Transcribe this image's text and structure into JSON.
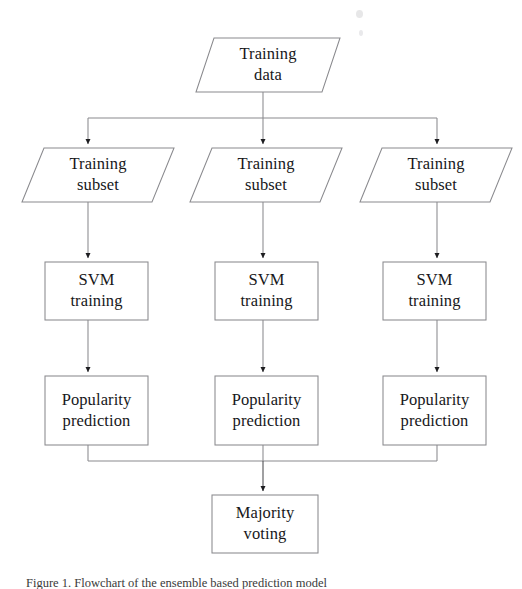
{
  "diagram": {
    "type": "flowchart",
    "orientation": "top-to-bottom",
    "stroke_color": "#8a8a8e",
    "text_color": "#17171a",
    "background": "#ffffff",
    "nodes": [
      {
        "id": "training-data",
        "shape": "parallelogram",
        "line1": "Training",
        "line2": "data",
        "x": 196,
        "y": 38,
        "w": 144,
        "h": 54
      },
      {
        "id": "training-subset-1",
        "shape": "parallelogram",
        "line1": "Training",
        "line2": "subset",
        "x": 22,
        "y": 148,
        "w": 152,
        "h": 54
      },
      {
        "id": "training-subset-2",
        "shape": "parallelogram",
        "line1": "Training",
        "line2": "subset",
        "x": 190,
        "y": 148,
        "w": 152,
        "h": 54
      },
      {
        "id": "training-subset-3",
        "shape": "parallelogram",
        "line1": "Training",
        "line2": "subset",
        "x": 360,
        "y": 148,
        "w": 152,
        "h": 54
      },
      {
        "id": "svm-training-1",
        "shape": "rectangle",
        "line1": "SVM",
        "line2": "training",
        "x": 45,
        "y": 262,
        "w": 103,
        "h": 58
      },
      {
        "id": "svm-training-2",
        "shape": "rectangle",
        "line1": "SVM",
        "line2": "training",
        "x": 215,
        "y": 262,
        "w": 103,
        "h": 58
      },
      {
        "id": "svm-training-3",
        "shape": "rectangle",
        "line1": "SVM",
        "line2": "training",
        "x": 383,
        "y": 262,
        "w": 103,
        "h": 58
      },
      {
        "id": "popularity-prediction-1",
        "shape": "rectangle",
        "line1": "Popularity",
        "line2": "prediction",
        "x": 45,
        "y": 376,
        "w": 103,
        "h": 69
      },
      {
        "id": "popularity-prediction-2",
        "shape": "rectangle",
        "line1": "Popularity",
        "line2": "prediction",
        "x": 215,
        "y": 376,
        "w": 103,
        "h": 69
      },
      {
        "id": "popularity-prediction-3",
        "shape": "rectangle",
        "line1": "Popularity",
        "line2": "prediction",
        "x": 383,
        "y": 376,
        "w": 103,
        "h": 69
      },
      {
        "id": "majority-voting",
        "shape": "rectangle",
        "line1": "Majority",
        "line2": "voting",
        "x": 212,
        "y": 495,
        "w": 106,
        "h": 58
      }
    ],
    "connectors": [
      {
        "id": "data-to-bus",
        "from": "training-data",
        "to": "split-bus",
        "arrow": false
      },
      {
        "id": "bus-to-subset-1",
        "from": "split-bus",
        "to": "training-subset-1",
        "arrow": true
      },
      {
        "id": "bus-to-subset-2",
        "from": "split-bus",
        "to": "training-subset-2",
        "arrow": true
      },
      {
        "id": "bus-to-subset-3",
        "from": "split-bus",
        "to": "training-subset-3",
        "arrow": true
      },
      {
        "id": "subset-1-to-svm-1",
        "from": "training-subset-1",
        "to": "svm-training-1",
        "arrow": true
      },
      {
        "id": "subset-2-to-svm-2",
        "from": "training-subset-2",
        "to": "svm-training-2",
        "arrow": true
      },
      {
        "id": "subset-3-to-svm-3",
        "from": "training-subset-3",
        "to": "svm-training-3",
        "arrow": true
      },
      {
        "id": "svm-1-to-pred-1",
        "from": "svm-training-1",
        "to": "popularity-prediction-1",
        "arrow": true
      },
      {
        "id": "svm-2-to-pred-2",
        "from": "svm-training-2",
        "to": "popularity-prediction-2",
        "arrow": true
      },
      {
        "id": "svm-3-to-pred-3",
        "from": "svm-training-3",
        "to": "popularity-prediction-3",
        "arrow": true
      },
      {
        "id": "pred-1-to-merge",
        "from": "popularity-prediction-1",
        "to": "merge-bus",
        "arrow": false
      },
      {
        "id": "pred-2-to-merge",
        "from": "popularity-prediction-2",
        "to": "merge-bus",
        "arrow": false
      },
      {
        "id": "pred-3-to-merge",
        "from": "popularity-prediction-3",
        "to": "merge-bus",
        "arrow": false
      },
      {
        "id": "merge-to-voting",
        "from": "merge-bus",
        "to": "majority-voting",
        "arrow": true
      }
    ]
  },
  "caption": {
    "text": "Figure 1.  Flowchart of the ensemble based prediction model"
  }
}
